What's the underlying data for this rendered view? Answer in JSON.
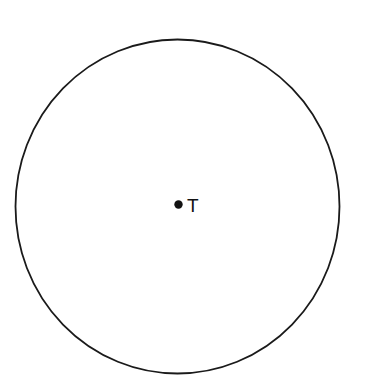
{
  "figure": {
    "type": "geometry-diagram",
    "canvas": {
      "width": 367,
      "height": 387,
      "background_color": "#ffffff"
    },
    "circle": {
      "name": "circle-outline",
      "center_x": 177.5,
      "center_y": 206.5,
      "radius_x": 162,
      "radius_y": 167,
      "stroke_color": "#1a1a1a",
      "stroke_width": 1.8,
      "fill": "none"
    },
    "center_point": {
      "name": "center-point-T",
      "x": 178.5,
      "y": 204.5,
      "radius": 4.2,
      "fill_color": "#121212"
    },
    "center_label": {
      "text": "T",
      "x": 187,
      "y": 212,
      "font_size": 19,
      "color": "#121212"
    }
  }
}
